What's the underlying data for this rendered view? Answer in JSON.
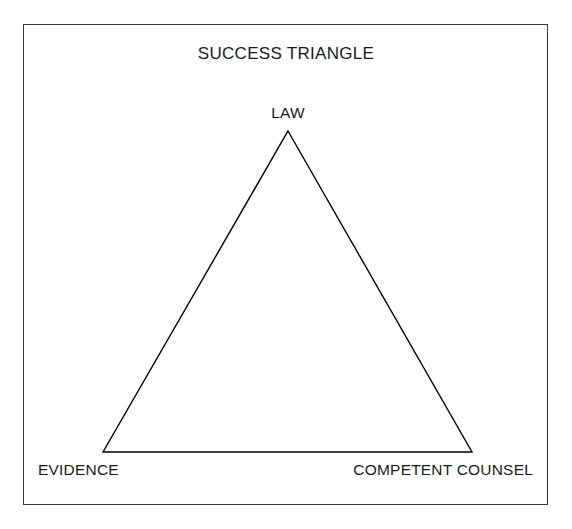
{
  "figure": {
    "title": "SUCCESS TRIANGLE",
    "background_color": "#ffffff",
    "frame_color": "#3a3a3a",
    "stroke_color": "#000000",
    "text_color": "#1a1a1a"
  },
  "chart_data": {
    "type": "diagram",
    "shape": "triangle",
    "title": "SUCCESS TRIANGLE",
    "xlabel": "",
    "ylabel": "",
    "legend": [],
    "grid": false,
    "vertices": [
      {
        "id": "apex",
        "label": "LAW",
        "x": 288,
        "y": 131,
        "label_position": "above"
      },
      {
        "id": "bottom-left",
        "label": "EVIDENCE",
        "x": 103,
        "y": 452,
        "label_position": "below-left"
      },
      {
        "id": "bottom-right",
        "label": "COMPETENT COUNSEL",
        "x": 472,
        "y": 452,
        "label_position": "below-right"
      }
    ],
    "edges": [
      {
        "from": "apex",
        "to": "bottom-right"
      },
      {
        "from": "bottom-right",
        "to": "bottom-left"
      },
      {
        "from": "bottom-left",
        "to": "apex"
      }
    ],
    "polygon_points": "288,131 472,452 103,452"
  },
  "labels": {
    "apex": "LAW",
    "bottom_left": "EVIDENCE",
    "bottom_right": "COMPETENT COUNSEL"
  }
}
